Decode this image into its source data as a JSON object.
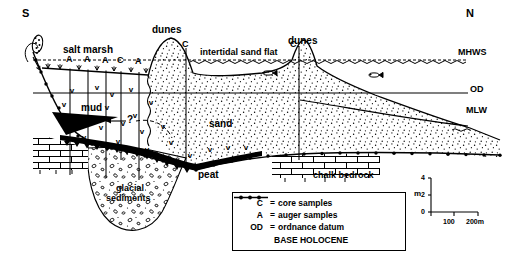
{
  "figure": {
    "type": "geological-cross-section",
    "orientation_left": "S",
    "orientation_right": "N"
  },
  "surface_labels": {
    "salt_marsh": "salt marsh",
    "dunes_left": "dunes",
    "dunes_right": "dunes",
    "intertidal_sand_flat": "intertidal sand flat"
  },
  "unit_labels": {
    "mud": "mud",
    "sand": "sand",
    "peat": "peat",
    "glacial_sediments_line1": "glacial",
    "glacial_sediments_line2": "sediments",
    "chalk_bedrock": "chalk bedrock",
    "query": "?"
  },
  "datum_labels": {
    "mhws": "MHWS",
    "od": "OD",
    "mlw": "MLW"
  },
  "boreholes": [
    {
      "id": "bh1",
      "label": "A",
      "x": 70
    },
    {
      "id": "bh2",
      "label": "A",
      "x": 88
    },
    {
      "id": "bh3",
      "label": "A",
      "x": 106
    },
    {
      "id": "bh4",
      "label": "C",
      "x": 121
    },
    {
      "id": "bh5",
      "label": "A",
      "x": 139
    },
    {
      "id": "bh6",
      "label": "C",
      "x": 186
    },
    {
      "id": "bh7",
      "label": "C",
      "x": 299
    }
  ],
  "legend": {
    "rows": [
      {
        "key": "C",
        "sep": "=",
        "value": "core samples"
      },
      {
        "key": "A",
        "sep": "=",
        "value": "auger samples"
      },
      {
        "key": "OD",
        "sep": "=",
        "value": "ordnance datum"
      }
    ],
    "symbol_row": {
      "symbol": "base-holocene-line",
      "value": "BASE HOLOCENE"
    }
  },
  "scale": {
    "vertical_unit": "m",
    "vertical_ticks": [
      "0",
      "2",
      "4"
    ],
    "horizontal_ticks": [
      "100",
      "200m"
    ]
  },
  "colors": {
    "ink": "#000000",
    "paper": "#ffffff",
    "peat_fill": "#000000"
  }
}
